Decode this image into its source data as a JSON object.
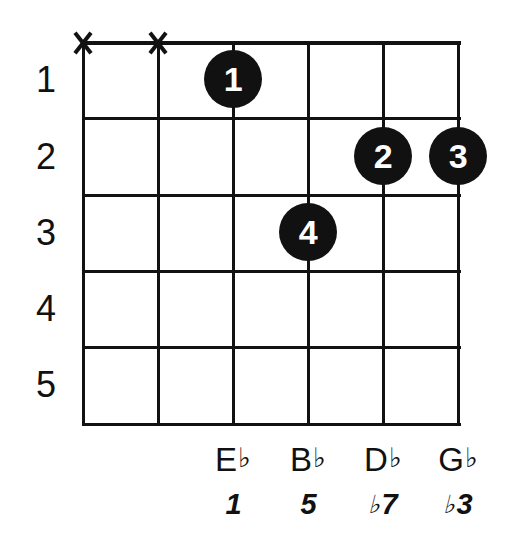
{
  "diagram": {
    "type": "guitar-chord-diagram",
    "frets_shown": 5,
    "strings_shown": 6,
    "ink_color": "#111111",
    "background_color": "#ffffff"
  },
  "fret_numbers": [
    {
      "label": "1"
    },
    {
      "label": "2"
    },
    {
      "label": "3"
    },
    {
      "label": "4"
    },
    {
      "label": "5"
    }
  ],
  "string_markers": [
    {
      "string": 1,
      "symbol": "X",
      "meaning": "muted"
    },
    {
      "string": 2,
      "symbol": "X",
      "meaning": "muted"
    }
  ],
  "finger_dots": [
    {
      "finger": "1",
      "string": 3,
      "fret": 1
    },
    {
      "finger": "4",
      "string": 4,
      "fret": 3
    },
    {
      "finger": "2",
      "string": 5,
      "fret": 2
    },
    {
      "finger": "3",
      "string": 6,
      "fret": 2
    }
  ],
  "note_names": [
    {
      "string": 3,
      "letter": "E",
      "accidental": "♭"
    },
    {
      "string": 4,
      "letter": "B",
      "accidental": "♭"
    },
    {
      "string": 5,
      "letter": "D",
      "accidental": "♭"
    },
    {
      "string": 6,
      "letter": "G",
      "accidental": "♭"
    }
  ],
  "intervals": [
    {
      "string": 3,
      "accidental": "",
      "degree": "1"
    },
    {
      "string": 4,
      "accidental": "",
      "degree": "5"
    },
    {
      "string": 5,
      "accidental": "♭",
      "degree": "7"
    },
    {
      "string": 6,
      "accidental": "♭",
      "degree": "3"
    }
  ]
}
